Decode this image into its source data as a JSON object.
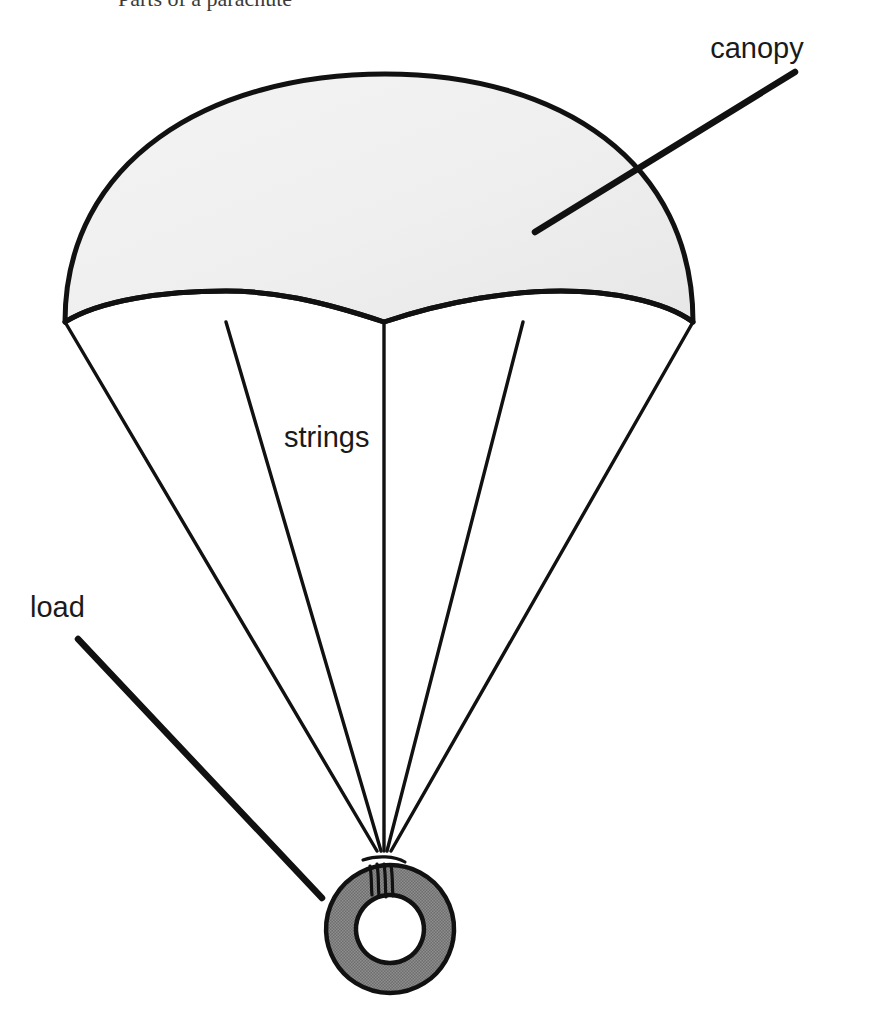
{
  "diagram": {
    "background_color": "#ffffff",
    "stroke_color": "#111111",
    "labels": {
      "canopy": "canopy",
      "strings": "strings",
      "load": "load"
    },
    "clipped_header": {
      "text": "Parts of a parachute",
      "note": "text row cropped at the very top edge of the screenshot; only descenders visible"
    },
    "parts": [
      {
        "name": "canopy",
        "label": "canopy",
        "fill_color": "#eff0ef",
        "outline_color": "#111111",
        "label_position": {
          "x": 757,
          "y": 58
        },
        "leader_line": {
          "x1": 795,
          "y1": 72,
          "x2": 535,
          "y2": 232
        },
        "scallop_count": 4,
        "apex": {
          "x": 385,
          "y": 74
        },
        "rim_y": 322,
        "rim_left_x": 65,
        "rim_right_x": 693
      },
      {
        "name": "strings",
        "label": "strings",
        "count": 5,
        "stroke_color": "#111111",
        "label_position": {
          "x": 284,
          "y": 447
        },
        "converge_point": {
          "x": 383,
          "y": 852
        },
        "attach_points_x": [
          65,
          226,
          384,
          523,
          693
        ]
      },
      {
        "name": "load",
        "label": "load",
        "shape": "annulus",
        "fill_color": "#7d7d7d",
        "outline_color": "#111111",
        "center": {
          "x": 390,
          "y": 929
        },
        "outer_radius": 64,
        "inner_radius": 34,
        "label_position": {
          "x": 30,
          "y": 617
        },
        "leader_line": {
          "x1": 78,
          "y1": 639,
          "x2": 322,
          "y2": 898
        }
      }
    ]
  }
}
